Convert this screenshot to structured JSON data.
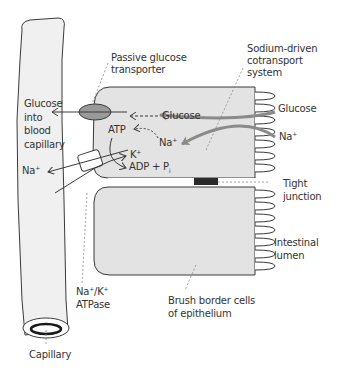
{
  "diagram": {
    "type": "biological-transport-diagram",
    "colors": {
      "cell_fill": "#e3e3e3",
      "capillary_fill": "#f0f0f0",
      "outline": "#3a3a3a",
      "arrow_gray": "#8a8a8a",
      "transporter_fill": "#9a9a9a",
      "tight_junction_fill": "#2a2a2a",
      "text": "#333333"
    },
    "labels": {
      "passive_transporter": "Passive glucose\ntransporter",
      "sodium_cotransport": "Sodium-driven\ncotransport\nsystem",
      "glucose_into_capillary": "Glucose\ninto\nblood\ncapillary",
      "glucose_inside": "Glucose",
      "glucose_lumen": "Glucose",
      "na_lumen": "Na",
      "na_lumen_sup": "+",
      "na_inside": "Na",
      "na_inside_sup": "+",
      "atp": "ATP",
      "k_plus": "K",
      "k_plus_sup": "+",
      "adp_pi": "ADP + P",
      "adp_pi_sub": "i",
      "na_out": "Na",
      "na_out_sup": "+",
      "tight_junction": "Tight\njunction",
      "intestinal_lumen": "Intestinal\nlumen",
      "brush_border": "Brush border cells\nof epithelium",
      "atpase_line1_a": "Na",
      "atpase_line1_sup1": "+",
      "atpase_line1_b": "/K",
      "atpase_line1_sup2": "+",
      "atpase_line2": "ATPase",
      "capillary": "Capillary"
    }
  }
}
